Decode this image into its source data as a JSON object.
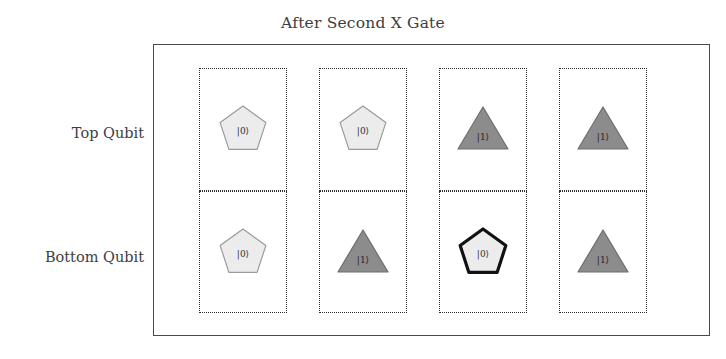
{
  "figure": {
    "title": "After Second X Gate"
  },
  "rows": [
    {
      "key": "top",
      "label": "Top Qubit"
    },
    {
      "key": "bottom",
      "label": "Bottom Qubit"
    }
  ],
  "colors": {
    "frame": "#4a4a4a",
    "cell_border": "#2d2d2d",
    "pentagon_fill": "#ececec",
    "pentagon_stroke": "#9a9a9a",
    "triangle_fill": "#8c8c8c",
    "triangle_stroke": "#6e6e6e",
    "highlight_stroke": "#111111",
    "text": "#3d3d3d"
  },
  "columns": [
    {
      "index": 1,
      "top": {
        "shape": "pentagon",
        "state": "|0⟩",
        "fill": "light",
        "highlighted": false
      },
      "bottom": {
        "shape": "pentagon",
        "state": "|0⟩",
        "fill": "light",
        "highlighted": false
      }
    },
    {
      "index": 2,
      "top": {
        "shape": "pentagon",
        "state": "|0⟩",
        "fill": "light",
        "highlighted": false
      },
      "bottom": {
        "shape": "triangle",
        "state": "|1⟩",
        "fill": "medium",
        "highlighted": false
      }
    },
    {
      "index": 3,
      "top": {
        "shape": "triangle",
        "state": "|1⟩",
        "fill": "medium",
        "highlighted": false
      },
      "bottom": {
        "shape": "pentagon",
        "state": "|0⟩",
        "fill": "light",
        "highlighted": true
      }
    },
    {
      "index": 4,
      "top": {
        "shape": "triangle",
        "state": "|1⟩",
        "fill": "medium",
        "highlighted": false
      },
      "bottom": {
        "shape": "triangle",
        "state": "|1⟩",
        "fill": "medium",
        "highlighted": false
      }
    }
  ]
}
